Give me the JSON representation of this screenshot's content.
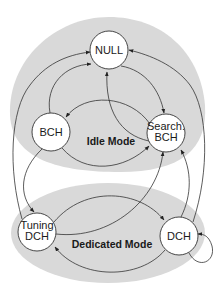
{
  "diagram": {
    "type": "state-machine",
    "regions": [
      {
        "id": "idle",
        "label": "Idle Mode",
        "fill": "#d8d8d8"
      },
      {
        "id": "dedicated",
        "label": "Dedicated Mode",
        "fill": "#d8d8d8"
      }
    ],
    "nodes": [
      {
        "id": "null",
        "label": "NULL",
        "region": "idle"
      },
      {
        "id": "bch",
        "label": "BCH",
        "region": "idle"
      },
      {
        "id": "search_bch",
        "line1": "Search.",
        "line2": "BCH",
        "region": "idle"
      },
      {
        "id": "tuning_dch",
        "line1": "Tuning",
        "line2": "DCH",
        "region": "dedicated"
      },
      {
        "id": "dch",
        "label": "DCH",
        "region": "dedicated"
      }
    ],
    "edges": [
      {
        "from": "null",
        "to": "search_bch"
      },
      {
        "from": "search_bch",
        "to": "null"
      },
      {
        "from": "search_bch",
        "to": "bch"
      },
      {
        "from": "bch",
        "to": "null"
      },
      {
        "from": "bch",
        "to": "search_bch"
      },
      {
        "from": "bch",
        "to": "tuning_dch"
      },
      {
        "from": "tuning_dch",
        "to": "null"
      },
      {
        "from": "tuning_dch",
        "to": "dch"
      },
      {
        "from": "tuning_dch",
        "to": "search_bch"
      },
      {
        "from": "dch",
        "to": "tuning_dch"
      },
      {
        "from": "dch",
        "to": "search_bch"
      },
      {
        "from": "dch",
        "to": "null"
      },
      {
        "from": "dch",
        "to": "dch"
      }
    ]
  }
}
